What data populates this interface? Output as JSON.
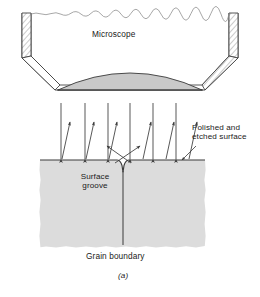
{
  "figure": {
    "caption": "(a)",
    "labels": {
      "microscope": "Microscope",
      "polished_surface": "Polished and\netched surface",
      "surface_groove": "Surface\ngroove",
      "grain_boundary": "Grain boundary"
    },
    "colors": {
      "line": "#3a3a3a",
      "specimen_fill": "#dcdcdc",
      "lens_fill": "#c9c9c9",
      "microscope_body_fill": "#ffffff",
      "hatch_fill": "#e8e8e8",
      "text": "#1a1a1a",
      "background": "#ffffff"
    },
    "geometry": {
      "microscope_top_y": 13,
      "surface_y": 160,
      "specimen_left_x": 40,
      "specimen_right_x": 205,
      "specimen_bottom_y": 248,
      "grain_boundary_x": 123,
      "incident_ray_count": 6,
      "incident_ray_x": [
        61,
        85,
        108,
        130,
        153,
        176
      ],
      "reflected_ray_count": 6,
      "groove_reflected_ray_count": 2
    }
  }
}
